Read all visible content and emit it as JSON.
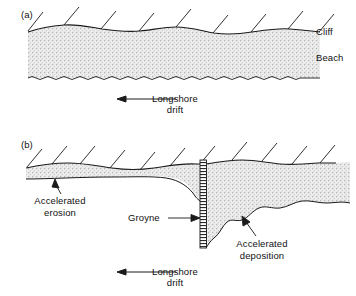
{
  "figure": {
    "kind": "coastal-geomorphology-cross-section",
    "background_color": "#ffffff",
    "line_color": "#1a1a1a",
    "beach_fill_color": "#e8e8e8",
    "panels": [
      {
        "tag": "(a)",
        "caption_labels": [
          "Cliff",
          "Beach"
        ],
        "cliff_label": "Cliff",
        "beach_label": "Beach",
        "drift_label_line1": "Longshore",
        "drift_label_line2": "drift",
        "drift_direction": "left"
      },
      {
        "tag": "(b)",
        "erosion_label_line1": "Accelerated",
        "erosion_label_line2": "erosion",
        "groyne_label": "Groyne",
        "deposition_label_line1": "Accelerated",
        "deposition_label_line2": "deposition",
        "drift_label_line1": "Longshore",
        "drift_label_line2": "drift",
        "drift_direction": "left"
      }
    ]
  },
  "panel_a": {
    "tag": "(a)",
    "cliff": "Cliff",
    "beach": "Beach",
    "drift1": "Longshore",
    "drift2": "drift"
  },
  "panel_b": {
    "tag": "(b)",
    "erosion1": "Accelerated",
    "erosion2": "erosion",
    "groyne": "Groyne",
    "deposition1": "Accelerated",
    "deposition2": "deposition",
    "drift1": "Longshore",
    "drift2": "drift"
  }
}
